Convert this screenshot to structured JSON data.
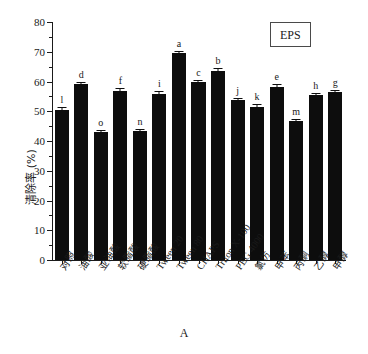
{
  "figure": {
    "panel_label": "A",
    "legend_label": "EPS"
  },
  "chart_data": {
    "type": "bar",
    "title": "",
    "xlabel": "A",
    "ylabel": "清除率 (%)",
    "ylim": [
      0,
      80
    ],
    "ytick_labels": [
      "0",
      "10",
      "20",
      "30",
      "40",
      "50",
      "60",
      "70",
      "80"
    ],
    "ytick_values": [
      0,
      10,
      20,
      30,
      40,
      50,
      60,
      70,
      80
    ],
    "yminor_values": [
      5,
      15,
      25,
      35,
      45,
      55,
      65,
      75
    ],
    "grid": false,
    "legend_position": "top-right",
    "legend_entries": [
      "EPS"
    ],
    "bar_color": "#0d0d0d",
    "categories": [
      "对照",
      "油酸",
      "亚油酸",
      "软脂酸",
      "硬脂酸",
      "Tween 20",
      "Tween 80",
      "CHAPS",
      "Triton X-100",
      "PEG 4000",
      "氯仿",
      "甲苯",
      "丙酮",
      "乙醇",
      "甲醇"
    ],
    "category_is_latin": [
      false,
      false,
      false,
      false,
      false,
      true,
      true,
      true,
      true,
      true,
      false,
      false,
      false,
      false,
      false
    ],
    "values": [
      50.5,
      59.0,
      43.0,
      56.8,
      43.5,
      55.8,
      69.5,
      60.0,
      63.6,
      53.8,
      51.6,
      58.2,
      46.8,
      55.4,
      56.4
    ],
    "errors": [
      1.1,
      0.9,
      0.6,
      1.0,
      0.5,
      0.9,
      0.8,
      0.4,
      0.8,
      0.7,
      0.9,
      0.8,
      0.6,
      0.8,
      0.8
    ],
    "annotations": [
      "l",
      "d",
      "o",
      "f",
      "n",
      "i",
      "a",
      "c",
      "b",
      "j",
      "k",
      "e",
      "m",
      "h",
      "g"
    ],
    "annotation_note": "significance letters above each bar"
  }
}
